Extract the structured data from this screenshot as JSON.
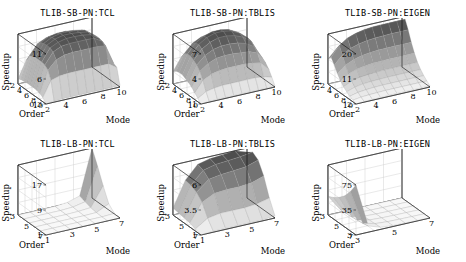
{
  "figure": {
    "background": "#ffffff",
    "rows": 2,
    "cols": 3,
    "axis_label_z": "Speedup",
    "axis_label_x": "Mode",
    "axis_label_y": "Order"
  },
  "chart_data": [
    {
      "type": "heatmap",
      "render": "surface3d",
      "title": "TLIB-SB-PN:TCL",
      "xlabel": "Mode",
      "ylabel": "Order",
      "zlabel": "Speedup",
      "xticks": [
        "2",
        "4",
        "6",
        "8",
        "10"
      ],
      "yticks": [
        "10",
        "8",
        "6",
        "4",
        "2"
      ],
      "zticks": [
        "11",
        "6",
        "0.3"
      ],
      "zlim": [
        0.3,
        11
      ],
      "x": [
        1,
        2,
        3,
        4,
        5,
        6,
        7,
        8,
        9,
        10
      ],
      "y": [
        1,
        2,
        3,
        4,
        5,
        6,
        7,
        8,
        9,
        10
      ],
      "values": [
        [
          0.3,
          0.5,
          0.6,
          0.6,
          0.6,
          0.6,
          0.6,
          0.6,
          0.6,
          0.6
        ],
        [
          1.2,
          4.5,
          5.0,
          5.2,
          5.2,
          5.2,
          5.2,
          5.2,
          5.2,
          4.0
        ],
        [
          1.6,
          6.2,
          8.0,
          8.6,
          8.8,
          8.8,
          8.8,
          8.8,
          8.6,
          4.4
        ],
        [
          1.8,
          6.8,
          9.2,
          10.0,
          10.2,
          10.2,
          10.2,
          10.1,
          9.0,
          4.5
        ],
        [
          1.9,
          7.0,
          9.6,
          10.4,
          10.8,
          10.8,
          10.7,
          10.4,
          9.2,
          4.6
        ],
        [
          1.9,
          7.0,
          9.7,
          10.6,
          11.0,
          11.0,
          10.8,
          10.5,
          9.2,
          4.6
        ],
        [
          1.9,
          7.0,
          9.6,
          10.5,
          10.9,
          10.9,
          10.7,
          10.4,
          9.1,
          4.6
        ],
        [
          1.8,
          6.8,
          9.3,
          10.2,
          10.5,
          10.5,
          10.3,
          10.0,
          8.8,
          4.5
        ],
        [
          1.7,
          6.4,
          8.6,
          9.4,
          9.6,
          9.6,
          9.4,
          9.0,
          8.0,
          4.3
        ],
        [
          1.4,
          5.0,
          6.0,
          6.4,
          6.5,
          6.5,
          6.4,
          6.2,
          5.6,
          3.6
        ]
      ]
    },
    {
      "type": "heatmap",
      "render": "surface3d",
      "title": "TLIB-SB-PN:TBLIS",
      "xlabel": "Mode",
      "ylabel": "Order",
      "zlabel": "Speedup",
      "xticks": [
        "2",
        "4",
        "6",
        "8",
        "10"
      ],
      "yticks": [
        "10",
        "8",
        "6",
        "4",
        "2"
      ],
      "zticks": [
        "7",
        "4",
        "1"
      ],
      "zlim": [
        1,
        7
      ],
      "x": [
        1,
        2,
        3,
        4,
        5,
        6,
        7,
        8,
        9,
        10
      ],
      "y": [
        1,
        2,
        3,
        4,
        5,
        6,
        7,
        8,
        9,
        10
      ],
      "values": [
        [
          1.0,
          1.1,
          1.1,
          1.1,
          1.1,
          1.1,
          1.1,
          1.1,
          1.1,
          1.1
        ],
        [
          1.4,
          2.0,
          2.2,
          2.3,
          2.3,
          2.3,
          2.3,
          2.3,
          2.2,
          1.9
        ],
        [
          1.8,
          3.1,
          3.6,
          3.8,
          3.9,
          3.9,
          3.9,
          3.8,
          3.6,
          2.6
        ],
        [
          2.2,
          3.9,
          4.6,
          5.0,
          5.1,
          5.1,
          5.0,
          4.9,
          4.5,
          3.1
        ],
        [
          2.5,
          4.4,
          5.3,
          5.8,
          6.0,
          6.0,
          5.9,
          5.6,
          5.0,
          3.4
        ],
        [
          2.7,
          4.7,
          5.8,
          6.4,
          6.7,
          6.7,
          6.5,
          6.1,
          5.4,
          3.6
        ],
        [
          2.9,
          4.9,
          6.1,
          6.7,
          7.0,
          7.0,
          6.8,
          6.3,
          5.5,
          3.7
        ],
        [
          2.9,
          4.9,
          6.0,
          6.6,
          6.9,
          6.9,
          6.7,
          6.2,
          5.4,
          3.7
        ],
        [
          2.8,
          4.7,
          5.7,
          6.2,
          6.4,
          6.4,
          6.2,
          5.8,
          5.1,
          3.5
        ],
        [
          2.5,
          4.0,
          4.7,
          5.0,
          5.2,
          5.2,
          5.0,
          4.7,
          4.2,
          3.1
        ]
      ]
    },
    {
      "type": "heatmap",
      "render": "surface3d",
      "title": "TLIB-SB-PN:EIGEN",
      "xlabel": "Mode",
      "ylabel": "Order",
      "zlabel": "Speedup",
      "xticks": [
        "2",
        "4",
        "6",
        "8",
        "10"
      ],
      "yticks": [
        "10",
        "8",
        "6",
        "4",
        "2"
      ],
      "zticks": [
        "20",
        "11",
        "2"
      ],
      "zlim": [
        2,
        20
      ],
      "x": [
        1,
        2,
        3,
        4,
        5,
        6,
        7,
        8,
        9,
        10
      ],
      "y": [
        1,
        2,
        3,
        4,
        5,
        6,
        7,
        8,
        9,
        10
      ],
      "values": [
        [
          2.0,
          2.2,
          2.3,
          2.3,
          2.4,
          2.4,
          2.4,
          2.4,
          2.4,
          2.4
        ],
        [
          2.6,
          3.0,
          3.2,
          3.3,
          3.4,
          3.4,
          3.4,
          3.4,
          3.4,
          3.4
        ],
        [
          3.2,
          3.9,
          4.2,
          4.4,
          4.5,
          4.5,
          4.5,
          4.5,
          4.5,
          4.5
        ],
        [
          4.0,
          5.0,
          5.5,
          5.7,
          5.8,
          5.9,
          5.9,
          5.9,
          5.9,
          5.9
        ],
        [
          5.0,
          6.4,
          7.1,
          7.4,
          7.6,
          7.7,
          7.7,
          7.7,
          7.7,
          7.7
        ],
        [
          6.4,
          8.2,
          9.2,
          9.7,
          10.0,
          10.1,
          10.2,
          10.2,
          10.2,
          10.2
        ],
        [
          8.2,
          10.6,
          11.9,
          12.6,
          13.0,
          13.2,
          13.3,
          13.3,
          13.3,
          13.3
        ],
        [
          10.4,
          13.4,
          15.1,
          16.0,
          16.5,
          16.8,
          16.9,
          17.0,
          17.0,
          17.0
        ],
        [
          12.4,
          16.0,
          18.0,
          19.0,
          19.6,
          19.9,
          20.0,
          20.0,
          20.0,
          20.0
        ],
        [
          11.0,
          14.0,
          15.6,
          16.4,
          16.8,
          17.0,
          17.1,
          17.1,
          17.1,
          17.1
        ]
      ]
    },
    {
      "type": "heatmap",
      "render": "surface3d",
      "title": "TLIB-LB-PN:TCL",
      "xlabel": "Mode",
      "ylabel": "Order",
      "zlabel": "Speedup",
      "xticks": [
        "1",
        "3",
        "5",
        "7"
      ],
      "yticks": [
        "7",
        "5",
        "3"
      ],
      "zticks": [
        "17",
        "9",
        "1"
      ],
      "zlim": [
        1,
        17
      ],
      "x": [
        1,
        2,
        3,
        4,
        5,
        6,
        7
      ],
      "y": [
        2,
        3,
        4,
        5,
        6,
        7
      ],
      "values": [
        [
          1.0,
          1.0,
          1.0,
          1.0,
          1.0,
          1.0,
          1.0
        ],
        [
          1.0,
          1.0,
          1.0,
          1.0,
          1.0,
          1.0,
          1.2
        ],
        [
          1.0,
          1.0,
          1.0,
          1.0,
          1.0,
          1.1,
          3.0
        ],
        [
          1.0,
          1.0,
          1.0,
          1.0,
          1.1,
          1.4,
          7.5
        ],
        [
          1.0,
          1.0,
          1.0,
          1.0,
          1.2,
          2.0,
          12.5
        ],
        [
          1.0,
          1.0,
          1.0,
          1.1,
          1.4,
          2.6,
          17.0
        ]
      ]
    },
    {
      "type": "heatmap",
      "render": "surface3d",
      "title": "TLIB-LB-PN:TBLIS",
      "xlabel": "Mode",
      "ylabel": "Order",
      "zlabel": "Speedup",
      "xticks": [
        "1",
        "3",
        "5",
        "7"
      ],
      "yticks": [
        "7",
        "5",
        "3"
      ],
      "zticks": [
        "6",
        "3.5",
        "1"
      ],
      "zlim": [
        1,
        6
      ],
      "x": [
        1,
        2,
        3,
        4,
        5,
        6,
        7
      ],
      "y": [
        2,
        3,
        4,
        5,
        6,
        7
      ],
      "values": [
        [
          1.0,
          1.1,
          1.1,
          1.1,
          1.1,
          1.1,
          1.2
        ],
        [
          1.2,
          2.0,
          2.2,
          2.2,
          2.2,
          2.3,
          2.6
        ],
        [
          1.4,
          3.2,
          3.8,
          3.9,
          3.9,
          4.0,
          4.4
        ],
        [
          1.5,
          3.8,
          4.8,
          5.0,
          5.1,
          5.2,
          5.6
        ],
        [
          1.6,
          4.1,
          5.3,
          5.6,
          5.7,
          5.8,
          6.0
        ],
        [
          1.7,
          4.2,
          5.5,
          5.8,
          5.9,
          6.0,
          5.6
        ]
      ]
    },
    {
      "type": "heatmap",
      "render": "surface3d",
      "title": "TLIB-LB-PN:EIGEN",
      "xlabel": "Mode",
      "ylabel": "Order",
      "zlabel": "Speedup",
      "xticks": [
        "3",
        "5",
        "7"
      ],
      "yticks": [
        "7",
        "5",
        "3"
      ],
      "zticks": [
        "75",
        "35",
        "3"
      ],
      "zlim": [
        3,
        75
      ],
      "x": [
        1,
        2,
        3,
        4,
        5,
        6,
        7
      ],
      "y": [
        2,
        3,
        4,
        5,
        6,
        7
      ],
      "values": [
        [
          75.0,
          12.0,
          6.0,
          4.5,
          4.0,
          3.6,
          3.4
        ],
        [
          60.0,
          10.0,
          5.5,
          4.2,
          3.8,
          3.5,
          3.3
        ],
        [
          48.0,
          9.0,
          5.0,
          4.0,
          3.6,
          3.4,
          3.2
        ],
        [
          40.0,
          8.0,
          4.6,
          3.8,
          3.5,
          3.3,
          3.1
        ],
        [
          34.0,
          7.2,
          4.3,
          3.6,
          3.3,
          3.2,
          3.1
        ],
        [
          30.0,
          6.6,
          4.0,
          3.4,
          3.2,
          3.1,
          3.0
        ]
      ]
    }
  ]
}
